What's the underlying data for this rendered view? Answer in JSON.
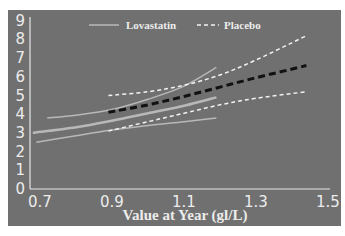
{
  "chart_data": {
    "type": "line",
    "title": "",
    "xlabel": "Value at Year (gl/L)",
    "ylabel": "",
    "xlim": [
      0.67,
      1.52
    ],
    "ylim": [
      0,
      9
    ],
    "x_ticks": [
      "0.7",
      "0.9",
      "1.1",
      "1.3",
      "1.5"
    ],
    "y_ticks": [
      "0",
      "1",
      "2",
      "3",
      "4",
      "5",
      "6",
      "7",
      "8",
      "9"
    ],
    "grid": false,
    "legend_position": "top",
    "legend": [
      {
        "name": "Lovastatin",
        "style": "solid",
        "color": "#b8b8b8"
      },
      {
        "name": "Placebo",
        "style": "dashed",
        "color": "#ffffff"
      }
    ],
    "series": [
      {
        "name": "Lovastatin mean",
        "group": "Lovastatin",
        "style": "solid",
        "color": "#b8b8b8",
        "width": 2.5,
        "x": [
          0.68,
          0.8,
          0.9,
          1.0,
          1.1,
          1.19
        ],
        "y": [
          3.0,
          3.3,
          3.65,
          4.05,
          4.45,
          4.9
        ]
      },
      {
        "name": "Lovastatin upper CI",
        "group": "Lovastatin",
        "style": "solid",
        "color": "#b8b8b8",
        "width": 1.5,
        "x": [
          0.72,
          0.8,
          0.9,
          1.0,
          1.1,
          1.19
        ],
        "y": [
          3.8,
          3.95,
          4.25,
          4.8,
          5.5,
          6.5
        ]
      },
      {
        "name": "Lovastatin lower CI",
        "group": "Lovastatin",
        "style": "solid",
        "color": "#b8b8b8",
        "width": 1.5,
        "x": [
          0.69,
          0.8,
          0.9,
          1.0,
          1.1,
          1.19
        ],
        "y": [
          2.5,
          2.85,
          3.15,
          3.4,
          3.6,
          3.8
        ]
      },
      {
        "name": "Placebo mean",
        "group": "Placebo",
        "style": "dashed",
        "color": "#111111",
        "width": 3,
        "x": [
          0.89,
          1.0,
          1.1,
          1.2,
          1.3,
          1.44
        ],
        "y": [
          4.1,
          4.5,
          4.95,
          5.45,
          5.95,
          6.6
        ]
      },
      {
        "name": "Placebo upper CI",
        "group": "Placebo",
        "style": "dashed",
        "color": "#f2f2f2",
        "width": 1.5,
        "x": [
          0.89,
          1.0,
          1.1,
          1.2,
          1.3,
          1.44
        ],
        "y": [
          5.0,
          5.2,
          5.55,
          6.1,
          6.9,
          8.2
        ]
      },
      {
        "name": "Placebo lower CI",
        "group": "Placebo",
        "style": "dashed",
        "color": "#f2f2f2",
        "width": 1.5,
        "x": [
          0.89,
          1.0,
          1.1,
          1.2,
          1.3,
          1.44
        ],
        "y": [
          3.1,
          3.6,
          4.05,
          4.5,
          4.85,
          5.2
        ]
      }
    ]
  },
  "colors": {
    "panel_bg": "#707070",
    "axis": "#e6e6e6",
    "text": "#ececec"
  }
}
